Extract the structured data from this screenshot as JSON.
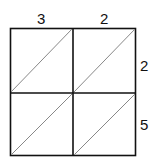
{
  "diagram": {
    "type": "lattice-multiplication-grid",
    "top_digits": [
      "3",
      "2"
    ],
    "right_digits": [
      "2",
      "5"
    ],
    "rows": 2,
    "cols": 2,
    "line_color": "#111111",
    "diagonal_color": "#888888"
  }
}
